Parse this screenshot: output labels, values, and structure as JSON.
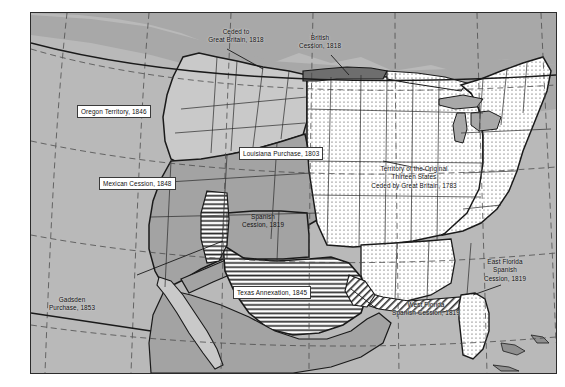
{
  "map": {
    "title": "United States Territorial Acquisitions",
    "frame": {
      "border_color": "#2b2b2b",
      "background_color": "#b9b9b9"
    },
    "palette": {
      "ocean_and_foreign": "#b9b9b9",
      "light_gray_territory": "#c9c9c9",
      "medium_gray_territory": "#a3a3a3",
      "dark_gray_cession": "#6e6e6e",
      "dotted_fill_base": "#ffffff",
      "dot_color": "#3a3a3a",
      "hatch_line_color": "#2f2f2f",
      "boundary_color": "#1a1a1a",
      "graticule_color": "#4a4a4a"
    },
    "labels": [
      {
        "id": "ceded-great-britain-1818",
        "text": "Ceded to\nGreat Britain, 1818",
        "style": "plain"
      },
      {
        "id": "british-cession-1818",
        "text": "British\nCession, 1818",
        "style": "plain"
      },
      {
        "id": "oregon-territory-1846",
        "text": "Oregon Territory, 1846",
        "style": "boxed"
      },
      {
        "id": "mexican-cession-1848",
        "text": "Mexican Cession, 1848",
        "style": "boxed"
      },
      {
        "id": "louisiana-purchase-1803",
        "text": "Louisiana Purchase, 1803",
        "style": "boxed"
      },
      {
        "id": "spanish-cession-1819",
        "text": "Spanish\nCession, 1819",
        "style": "ongray"
      },
      {
        "id": "texas-annexation-1845",
        "text": "Texas Annexation, 1845",
        "style": "boxed"
      },
      {
        "id": "gadsden-purchase-1853",
        "text": "Gadsden\nPurchase, 1853",
        "style": "plain"
      },
      {
        "id": "original-thirteen-states",
        "text": "Territory of the Original\nThirteen States\nCeded by Great Britain, 1783",
        "style": "onwhite"
      },
      {
        "id": "west-florida-spanish-cession-1819",
        "text": "West Florida\nSpanish Cession, 1819",
        "style": "plain"
      },
      {
        "id": "east-florida-spanish-cession-1819",
        "text": "East Florida\nSpanish\nCession, 1819",
        "style": "plain"
      }
    ],
    "territories": [
      {
        "id": "oregon-territory",
        "name": "Oregon Territory",
        "year": "1846",
        "fill": "light-gray"
      },
      {
        "id": "mexican-cession",
        "name": "Mexican Cession",
        "year": "1848",
        "fill": "medium-gray"
      },
      {
        "id": "louisiana-purchase",
        "name": "Louisiana Purchase",
        "year": "1803",
        "fill": "dotted"
      },
      {
        "id": "spanish-cession",
        "name": "Spanish Cession",
        "year": "1819",
        "fill": "medium-gray"
      },
      {
        "id": "texas-annexation",
        "name": "Texas Annexation",
        "year": "1845",
        "fill": "horizontal-hatch"
      },
      {
        "id": "gadsden-purchase",
        "name": "Gadsden Purchase",
        "year": "1853",
        "fill": "medium-gray"
      },
      {
        "id": "original-thirteen",
        "name": "Territory of the Original Thirteen States",
        "year": "1783",
        "fill": "dotted"
      },
      {
        "id": "ceded-to-great-britain",
        "name": "Ceded to Great Britain",
        "year": "1818",
        "fill": "dark-gray"
      },
      {
        "id": "british-cession",
        "name": "British Cession",
        "year": "1818",
        "fill": "dotted"
      },
      {
        "id": "west-florida",
        "name": "West Florida Spanish Cession",
        "year": "1819",
        "fill": "diagonal-hatch"
      },
      {
        "id": "east-florida",
        "name": "East Florida Spanish Cession",
        "year": "1819",
        "fill": "dotted"
      }
    ],
    "graticule": {
      "style": "dashed",
      "visible": true
    }
  }
}
